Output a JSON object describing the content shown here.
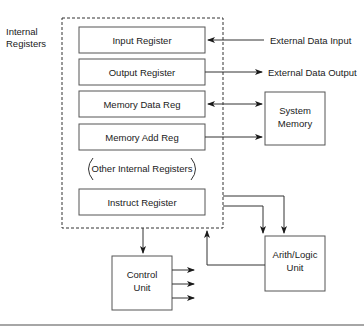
{
  "diagram": {
    "type": "cpu-block-diagram",
    "group_label_line1": "Internal",
    "group_label_line2": "Registers",
    "registers": [
      {
        "id": "input",
        "label": "Input Register"
      },
      {
        "id": "output",
        "label": "Output Register"
      },
      {
        "id": "mdr",
        "label": "Memory Data Reg"
      },
      {
        "id": "mar",
        "label": "Memory Add Reg"
      },
      {
        "id": "other",
        "label": "Other Internal Registers"
      },
      {
        "id": "ir",
        "label": "Instruct Register"
      }
    ],
    "external": {
      "input_label": "External Data Input",
      "output_label": "External Data Output"
    },
    "system_memory": {
      "line1": "System",
      "line2": "Memory"
    },
    "control_unit": {
      "line1": "Control",
      "line2": "Unit"
    },
    "alu": {
      "line1": "Arith/Logic",
      "line2": "Unit"
    },
    "connections": [
      {
        "from": "External Data Input",
        "to": "Input Register"
      },
      {
        "from": "Output Register",
        "to": "External Data Output"
      },
      {
        "from": "Memory Data Reg",
        "to": "System Memory",
        "bidirectional": true
      },
      {
        "from": "Memory Add Reg",
        "to": "System Memory"
      },
      {
        "from": "Internal Registers",
        "to": "Control Unit"
      },
      {
        "from": "Internal Registers",
        "to": "Arith/Logic Unit",
        "count": 2
      },
      {
        "from": "Arith/Logic Unit",
        "to": "Internal Registers"
      },
      {
        "from": "Control Unit",
        "to": "outputs",
        "count": 3
      }
    ],
    "colors": {
      "line": "#333333",
      "background": "#ffffff",
      "rule": "#888888"
    }
  }
}
